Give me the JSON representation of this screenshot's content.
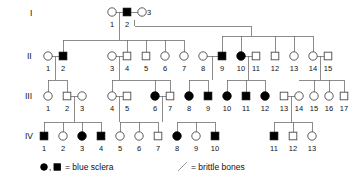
{
  "figure": {
    "type": "pedigree-chart",
    "title": "",
    "width": 355,
    "height": 181
  },
  "generation_labels": [
    {
      "label": "I",
      "x": 30,
      "y": 16
    },
    {
      "label": "II",
      "x": 27,
      "y": 59
    },
    {
      "label": "III",
      "x": 25,
      "y": 99
    },
    {
      "label": "IV",
      "x": 25,
      "y": 139
    }
  ],
  "legend": {
    "affected_symbols": "●, ■",
    "affected_label": "= blue sclera",
    "slash_label": "= brittle bones",
    "affected_color": "#000000",
    "line_color": "#6f6f6f"
  },
  "generations": [
    {
      "roman": "I",
      "y": 12,
      "number_y": 27,
      "individuals": [
        {
          "id": "1",
          "shape": "circle",
          "filled": false,
          "x": 112
        },
        {
          "id": "2",
          "shape": "square",
          "filled": true,
          "x": 127
        },
        {
          "id": "3",
          "shape": "circle",
          "filled": false,
          "x": 142,
          "number_side": "right"
        }
      ]
    },
    {
      "roman": "II",
      "y": 56,
      "number_y": 71,
      "individuals": [
        {
          "id": "1",
          "shape": "circle",
          "filled": false,
          "x": 48
        },
        {
          "id": "2",
          "shape": "square",
          "filled": true,
          "x": 63
        },
        {
          "id": "3",
          "shape": "circle",
          "filled": false,
          "x": 112
        },
        {
          "id": "4",
          "shape": "square",
          "filled": false,
          "x": 127
        },
        {
          "id": "5",
          "shape": "square",
          "filled": false,
          "x": 146
        },
        {
          "id": "6",
          "shape": "circle",
          "filled": false,
          "x": 165
        },
        {
          "id": "7",
          "shape": "circle",
          "filled": false,
          "x": 184
        },
        {
          "id": "8",
          "shape": "circle",
          "filled": false,
          "x": 203
        },
        {
          "id": "9",
          "shape": "square",
          "filled": true,
          "x": 222
        },
        {
          "id": "10",
          "shape": "circle",
          "filled": true,
          "x": 241
        },
        {
          "id": "11",
          "shape": "square",
          "filled": false,
          "x": 256
        },
        {
          "id": "12",
          "shape": "square",
          "filled": false,
          "x": 275
        },
        {
          "id": "13",
          "shape": "circle",
          "filled": false,
          "x": 294
        },
        {
          "id": "14",
          "shape": "circle",
          "filled": false,
          "x": 313
        },
        {
          "id": "15",
          "shape": "square",
          "filled": false,
          "x": 328
        }
      ]
    },
    {
      "roman": "III",
      "y": 96,
      "number_y": 111,
      "individuals": [
        {
          "id": "1",
          "shape": "circle",
          "filled": false,
          "x": 48
        },
        {
          "id": "2",
          "shape": "square",
          "filled": false,
          "x": 67
        },
        {
          "id": "3",
          "shape": "circle",
          "filled": false,
          "x": 82
        },
        {
          "id": "4",
          "shape": "circle",
          "filled": false,
          "x": 112
        },
        {
          "id": "5",
          "shape": "square",
          "filled": false,
          "x": 127
        },
        {
          "id": "6",
          "shape": "circle",
          "filled": true,
          "x": 155
        },
        {
          "id": "7",
          "shape": "square",
          "filled": false,
          "x": 170
        },
        {
          "id": "8",
          "shape": "circle",
          "filled": true,
          "x": 189
        },
        {
          "id": "9",
          "shape": "square",
          "filled": true,
          "x": 208
        },
        {
          "id": "10",
          "shape": "circle",
          "filled": true,
          "x": 227
        },
        {
          "id": "11",
          "shape": "square",
          "filled": true,
          "x": 246
        },
        {
          "id": "12",
          "shape": "circle",
          "filled": true,
          "x": 265
        },
        {
          "id": "13",
          "shape": "square",
          "filled": false,
          "x": 284
        },
        {
          "id": "14",
          "shape": "circle",
          "filled": false,
          "x": 299
        },
        {
          "id": "15",
          "shape": "circle",
          "filled": false,
          "x": 314
        },
        {
          "id": "16",
          "shape": "circle",
          "filled": false,
          "x": 329
        },
        {
          "id": "17",
          "shape": "square",
          "filled": false,
          "x": 344
        }
      ]
    },
    {
      "roman": "IV",
      "y": 136,
      "number_y": 151,
      "individuals": [
        {
          "id": "1",
          "shape": "square",
          "filled": true,
          "x": 44
        },
        {
          "id": "2",
          "shape": "circle",
          "filled": false,
          "x": 63
        },
        {
          "id": "3",
          "shape": "circle",
          "filled": true,
          "x": 82
        },
        {
          "id": "4",
          "shape": "square",
          "filled": true,
          "x": 101
        },
        {
          "id": "5",
          "shape": "circle",
          "filled": false,
          "x": 120
        },
        {
          "id": "6",
          "shape": "circle",
          "filled": false,
          "x": 139
        },
        {
          "id": "7",
          "shape": "square",
          "filled": false,
          "x": 158
        },
        {
          "id": "8",
          "shape": "circle",
          "filled": true,
          "x": 177
        },
        {
          "id": "9",
          "shape": "circle",
          "filled": false,
          "x": 196
        },
        {
          "id": "10",
          "shape": "square",
          "filled": true,
          "x": 215
        },
        {
          "id": "11",
          "shape": "square",
          "filled": true,
          "x": 274
        },
        {
          "id": "12",
          "shape": "square",
          "filled": false,
          "x": 293
        },
        {
          "id": "13",
          "shape": "circle",
          "filled": false,
          "x": 312
        }
      ]
    }
  ],
  "mating_lines": [
    {
      "name": "I-1 x I-2",
      "x1": 112,
      "x2": 127,
      "y": 12
    },
    {
      "name": "I-2 x I-3",
      "x1": 127,
      "x2": 142,
      "y": 12
    },
    {
      "name": "II-1 x II-2",
      "x1": 48,
      "x2": 63,
      "y": 56
    },
    {
      "name": "II-3 x II-4",
      "x1": 112,
      "x2": 127,
      "y": 56
    },
    {
      "name": "II-8 x II-9",
      "x1": 203,
      "x2": 222,
      "y": 56
    },
    {
      "name": "II-10 x II-11",
      "x1": 241,
      "x2": 256,
      "y": 56
    },
    {
      "name": "II-14 x II-15",
      "x1": 313,
      "x2": 328,
      "y": 56
    },
    {
      "name": "III-2 x III-3",
      "x1": 67,
      "x2": 82,
      "y": 96
    },
    {
      "name": "III-4 x III-5",
      "x1": 112,
      "x2": 127,
      "y": 96
    },
    {
      "name": "III-6 x III-7",
      "x1": 155,
      "x2": 170,
      "y": 96
    },
    {
      "name": "III-13 x III-14",
      "x1": 284,
      "x2": 299,
      "y": 96
    }
  ],
  "descent_lines": [
    {
      "name": "I-1xI-2 drop",
      "x": 119.5,
      "y1": 12,
      "y2": 40
    },
    {
      "name": "sibship-II-a",
      "x1": 63,
      "x2": 184,
      "y": 40
    },
    {
      "name": "II-2 up",
      "x": 63,
      "y1": 40,
      "y2": 56
    },
    {
      "name": "II-4 up",
      "x": 127,
      "y1": 40,
      "y2": 56
    },
    {
      "name": "II-5 up",
      "x": 146,
      "y1": 40,
      "y2": 56
    },
    {
      "name": "II-6 up",
      "x": 165,
      "y1": 40,
      "y2": 56
    },
    {
      "name": "II-7 up",
      "x": 184,
      "y1": 40,
      "y2": 56
    },
    {
      "name": "I-2xI-3 drop",
      "x": 134.5,
      "y1": 20,
      "y2": 26
    },
    {
      "name": "I-2xI-3 across",
      "x1": 134.5,
      "x2": 251,
      "y": 26
    },
    {
      "name": "I-2xI-3 down",
      "x": 251,
      "y1": 26,
      "y2": 36
    },
    {
      "name": "sibship-II-b",
      "x1": 222,
      "x2": 313,
      "y": 36
    },
    {
      "name": "II-9 up",
      "x": 222,
      "y1": 36,
      "y2": 56
    },
    {
      "name": "II-10 up",
      "x": 241,
      "y1": 36,
      "y2": 56
    },
    {
      "name": "II-12 up",
      "x": 275,
      "y1": 36,
      "y2": 56
    },
    {
      "name": "II-13 up",
      "x": 294,
      "y1": 36,
      "y2": 56
    },
    {
      "name": "II-14 up",
      "x": 313,
      "y1": 36,
      "y2": 56
    },
    {
      "name": "II-1x2 drop",
      "x": 55.5,
      "y1": 56,
      "y2": 80
    },
    {
      "name": "sibship-III-a",
      "x1": 48,
      "x2": 67,
      "y": 80
    },
    {
      "name": "III-1 up",
      "x": 48,
      "y1": 80,
      "y2": 96
    },
    {
      "name": "III-2 up",
      "x": 67,
      "y1": 80,
      "y2": 96
    },
    {
      "name": "II-3x4 drop",
      "x": 119.5,
      "y1": 56,
      "y2": 80
    },
    {
      "name": "sibship-III-b",
      "x1": 112,
      "x2": 170,
      "y": 80
    },
    {
      "name": "III-4 up",
      "x": 112,
      "y1": 80,
      "y2": 96
    },
    {
      "name": "III-6 up",
      "x": 155,
      "y1": 80,
      "y2": 96
    },
    {
      "name": "III-7 up",
      "x": 170,
      "y1": 80,
      "y2": 96
    },
    {
      "name": "II-8x9 drop",
      "x": 212.5,
      "y1": 56,
      "y2": 80
    },
    {
      "name": "sibship-III-c",
      "x1": 189,
      "x2": 208,
      "y": 80
    },
    {
      "name": "III-8 up",
      "x": 189,
      "y1": 80,
      "y2": 96
    },
    {
      "name": "III-9 up",
      "x": 208,
      "y1": 80,
      "y2": 96
    },
    {
      "name": "II-10x11 drop",
      "x": 248.5,
      "y1": 56,
      "y2": 80
    },
    {
      "name": "sibship-III-d",
      "x1": 227,
      "x2": 265,
      "y": 80
    },
    {
      "name": "III-10 up",
      "x": 227,
      "y1": 80,
      "y2": 96
    },
    {
      "name": "III-11 up",
      "x": 246,
      "y1": 80,
      "y2": 96
    },
    {
      "name": "III-12 up",
      "x": 265,
      "y1": 80,
      "y2": 96
    },
    {
      "name": "II-14x15 drop",
      "x": 320.5,
      "y1": 56,
      "y2": 80
    },
    {
      "name": "sibship-III-e",
      "x1": 299,
      "x2": 344,
      "y": 80
    },
    {
      "name": "III-15 up",
      "x": 314,
      "y1": 80,
      "y2": 96
    },
    {
      "name": "III-16 up",
      "x": 329,
      "y1": 80,
      "y2": 96
    },
    {
      "name": "III-17 up",
      "x": 344,
      "y1": 80,
      "y2": 96
    },
    {
      "name": "III-2x3 drop",
      "x": 74.5,
      "y1": 96,
      "y2": 122
    },
    {
      "name": "sibship-IV-a",
      "x1": 44,
      "x2": 101,
      "y": 122
    },
    {
      "name": "IV-1 up",
      "x": 44,
      "y1": 122,
      "y2": 136
    },
    {
      "name": "IV-2 up",
      "x": 63,
      "y1": 122,
      "y2": 136
    },
    {
      "name": "IV-3 up",
      "x": 82,
      "y1": 122,
      "y2": 136
    },
    {
      "name": "IV-4 up",
      "x": 101,
      "y1": 122,
      "y2": 136
    },
    {
      "name": "III-4x5 drop",
      "x": 119.5,
      "y1": 96,
      "y2": 122
    },
    {
      "name": "sibship-IV-b",
      "x1": 120,
      "x2": 158,
      "y": 122
    },
    {
      "name": "IV-5 up",
      "x": 120,
      "y1": 122,
      "y2": 136
    },
    {
      "name": "IV-6 up",
      "x": 139,
      "y1": 122,
      "y2": 136
    },
    {
      "name": "IV-7 up",
      "x": 158,
      "y1": 122,
      "y2": 136
    },
    {
      "name": "III-6x7 drop",
      "x": 162.5,
      "y1": 96,
      "y2": 122
    },
    {
      "name": "sibship-IV-c",
      "x1": 177,
      "x2": 215,
      "y": 122
    },
    {
      "name": "IV-8 up",
      "x": 177,
      "y1": 122,
      "y2": 136
    },
    {
      "name": "IV-9 up",
      "x": 196,
      "y1": 122,
      "y2": 136
    },
    {
      "name": "IV-10 up",
      "x": 215,
      "y1": 122,
      "y2": 136
    },
    {
      "name": "III-13x14 drop",
      "x": 291.5,
      "y1": 96,
      "y2": 122
    },
    {
      "name": "sibship-IV-d",
      "x1": 274,
      "x2": 312,
      "y": 122
    },
    {
      "name": "IV-11 up",
      "x": 274,
      "y1": 122,
      "y2": 136
    },
    {
      "name": "IV-12 up",
      "x": 293,
      "y1": 122,
      "y2": 136
    },
    {
      "name": "IV-13 up",
      "x": 312,
      "y1": 122,
      "y2": 136
    }
  ]
}
